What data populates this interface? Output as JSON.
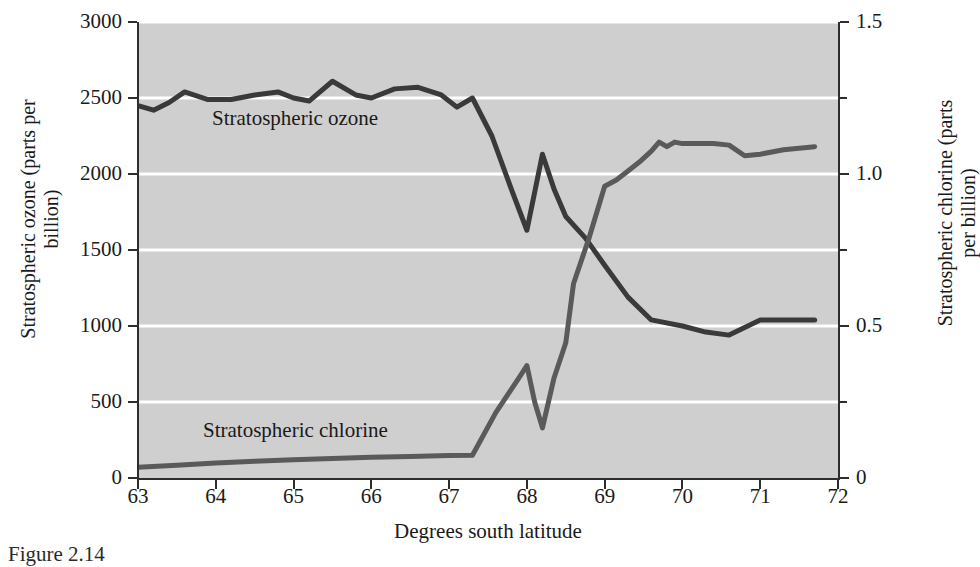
{
  "figure": {
    "caption": "Figure 2.14"
  },
  "chart_data": {
    "type": "line",
    "title": "",
    "xlabel": "Degrees south latitude",
    "ylabel": "Stratospheric ozone (parts per billion)",
    "y2label": "Stratospheric chlorine (parts per billion)",
    "xlim": [
      63,
      72
    ],
    "ylim": [
      0,
      3000
    ],
    "y2lim": [
      0,
      1.5
    ],
    "grid": true,
    "grid_axis": "y",
    "grid_color": "#ffffff",
    "plot_background": "#cfcfcf",
    "legend": "inline-annotations",
    "xticks": [
      63,
      64,
      65,
      66,
      67,
      68,
      69,
      70,
      71,
      72
    ],
    "xticklabels": [
      "63",
      "64",
      "65",
      "66",
      "67",
      "68",
      "69",
      "70",
      "71",
      "72"
    ],
    "yticks": [
      0,
      500,
      1000,
      1500,
      2000,
      2500,
      3000
    ],
    "yticklabels": [
      "0",
      "500",
      "1000",
      "1500",
      "2000",
      "2500",
      "3000"
    ],
    "y2ticks": [
      0,
      0.25,
      0.5,
      0.75,
      1.0,
      1.25,
      1.5
    ],
    "y2ticklabels": [
      "0",
      "",
      "0.5",
      "",
      "1.0",
      "",
      "1.5"
    ],
    "y2_labeled_ticks": [
      0,
      0.5,
      1.0,
      1.5
    ],
    "y2_minor_ticks": [
      0.25,
      0.75,
      1.25
    ],
    "series": [
      {
        "name": "Stratospheric ozone",
        "axis": "left",
        "units": "parts per billion",
        "color": "#3a3a3a",
        "linewidth": 5,
        "annotation": "Stratospheric ozone",
        "x": [
          63.0,
          63.2,
          63.4,
          63.6,
          63.9,
          64.2,
          64.5,
          64.8,
          65.0,
          65.2,
          65.5,
          65.8,
          66.0,
          66.3,
          66.6,
          66.9,
          67.1,
          67.3,
          67.55,
          67.8,
          68.0,
          68.1,
          68.2,
          68.35,
          68.5,
          68.75,
          69.0,
          69.3,
          69.6,
          70.0,
          70.3,
          70.6,
          71.0,
          71.7
        ],
        "y": [
          2450,
          2420,
          2470,
          2540,
          2490,
          2490,
          2520,
          2540,
          2500,
          2480,
          2610,
          2520,
          2500,
          2560,
          2570,
          2520,
          2440,
          2500,
          2250,
          1900,
          1630,
          1880,
          2130,
          1900,
          1720,
          1580,
          1400,
          1190,
          1040,
          1000,
          960,
          940,
          1040,
          1040
        ]
      },
      {
        "name": "Stratospheric chlorine",
        "axis": "right",
        "units": "parts per billion",
        "color": "#5a5a5a",
        "linewidth": 5,
        "annotation": "Stratospheric chlorine",
        "x": [
          63.0,
          63.5,
          64.0,
          64.5,
          65.0,
          65.5,
          66.0,
          66.5,
          67.0,
          67.3,
          67.6,
          67.9,
          68.0,
          68.1,
          68.2,
          68.35,
          68.5,
          68.6,
          68.8,
          69.0,
          69.15,
          69.3,
          69.45,
          69.6,
          69.7,
          69.8,
          69.9,
          70.0,
          70.2,
          70.4,
          70.6,
          70.8,
          71.0,
          71.3,
          71.7
        ],
        "y_right": [
          0.035,
          0.042,
          0.049,
          0.055,
          0.06,
          0.064,
          0.068,
          0.071,
          0.074,
          0.075,
          0.215,
          0.33,
          0.37,
          0.25,
          0.165,
          0.33,
          0.445,
          0.64,
          0.79,
          0.96,
          0.98,
          1.01,
          1.04,
          1.075,
          1.105,
          1.09,
          1.105,
          1.1,
          1.1,
          1.1,
          1.095,
          1.06,
          1.065,
          1.08,
          1.09
        ],
        "y_left_scaled": [
          70,
          84,
          98,
          110,
          120,
          128,
          136,
          142,
          148,
          150,
          430,
          660,
          740,
          500,
          330,
          660,
          890,
          1280,
          1580,
          1920,
          1960,
          2020,
          2080,
          2150,
          2210,
          2180,
          2210,
          2200,
          2200,
          2200,
          2190,
          2120,
          2130,
          2160,
          2180
        ]
      }
    ]
  }
}
